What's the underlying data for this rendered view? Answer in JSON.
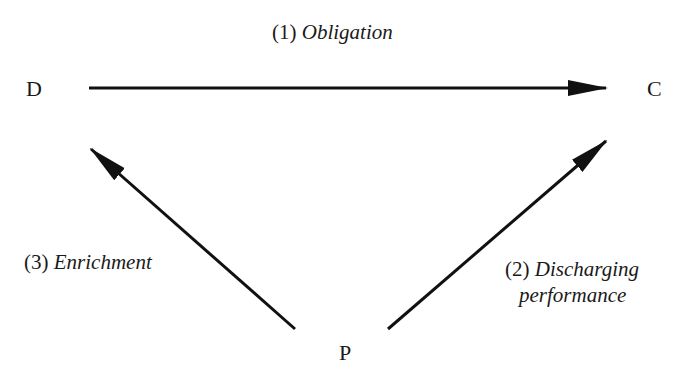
{
  "nodes": {
    "d": "D",
    "c": "C",
    "p": "P"
  },
  "edges": [
    {
      "from": "D",
      "to": "C",
      "number": "(1)",
      "label": "Obligation"
    },
    {
      "from": "P",
      "to": "C",
      "number": "(2)",
      "label_line1": "Discharging",
      "label_line2": "performance"
    },
    {
      "from": "P",
      "to": "D",
      "number": "(3)",
      "label": "Enrichment"
    }
  ],
  "colors": {
    "line": "#111111",
    "text": "#1a1a1a",
    "background": "#ffffff"
  }
}
